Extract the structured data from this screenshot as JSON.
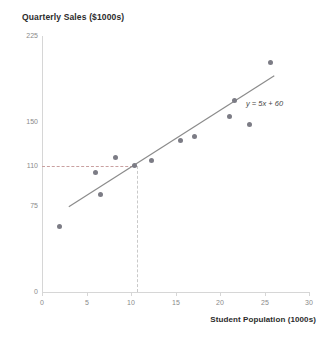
{
  "chart_data": {
    "type": "scatter",
    "title": "Quarterly Sales ($1000s)",
    "xlabel": "Student Population (1000s)",
    "ylabel": "Quarterly Sales ($1000s)",
    "xlim": [
      0,
      30
    ],
    "ylim": [
      0,
      225
    ],
    "xticks": [
      0,
      5,
      10,
      15,
      20,
      25,
      30
    ],
    "yticks": [
      0,
      75,
      110,
      150,
      225
    ],
    "grid": false,
    "legend": null,
    "series": [
      {
        "name": "Restaurants",
        "points": [
          {
            "x": 2,
            "y": 58
          },
          {
            "x": 6,
            "y": 105
          },
          {
            "x": 6.6,
            "y": 86
          },
          {
            "x": 8.2,
            "y": 118
          },
          {
            "x": 10.4,
            "y": 111
          },
          {
            "x": 12.3,
            "y": 116
          },
          {
            "x": 15.5,
            "y": 133
          },
          {
            "x": 17.1,
            "y": 137
          },
          {
            "x": 21,
            "y": 154
          },
          {
            "x": 21.6,
            "y": 168
          },
          {
            "x": 23.2,
            "y": 147
          },
          {
            "x": 25.6,
            "y": 202
          }
        ]
      }
    ],
    "trendline": {
      "equation": "y = 5x + 60",
      "slope": 5,
      "intercept": 60,
      "x_start": 3,
      "x_end": 26
    },
    "annotations": [
      {
        "name": "guide-lines",
        "type": "dashed-reference",
        "x": 10,
        "y": 110,
        "note": "dashed guides from y=110 to x=10"
      }
    ],
    "colors": {
      "marker": "#7c7c85",
      "line": "#8b8b8b",
      "axis": "#d6d6d6",
      "tick_text": "#8a8a8a",
      "title_text": "#2b2b2b",
      "guide_horizontal": "#c9a0a0",
      "guide_vertical": "#c9c9c9"
    }
  },
  "labels": {
    "y_0": "0",
    "y_75": "75",
    "y_110": "110",
    "y_150": "150",
    "y_225": "225",
    "x_0": "0",
    "x_5": "5",
    "x_10": "10",
    "x_15": "15",
    "x_20": "20",
    "x_25": "25",
    "x_30": "30",
    "equation": "y = 5x + 60"
  }
}
